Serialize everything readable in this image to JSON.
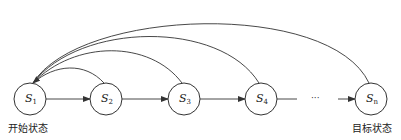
{
  "diagram": {
    "type": "state-transition",
    "nodes": [
      {
        "id": "s1",
        "label": "S",
        "sub": "1",
        "cx": 30,
        "cy": 99
      },
      {
        "id": "s2",
        "label": "S",
        "sub": "2",
        "cx": 106,
        "cy": 99
      },
      {
        "id": "s3",
        "label": "S",
        "sub": "3",
        "cx": 184,
        "cy": 99
      },
      {
        "id": "s4",
        "label": "S",
        "sub": "4",
        "cx": 261,
        "cy": 99
      },
      {
        "id": "sn",
        "label": "S",
        "sub": "n",
        "cx": 371,
        "cy": 99
      }
    ],
    "ellipsis": "···",
    "start_label": "开始状态",
    "goal_label": "目标状态",
    "forward_edges": [
      "s1→s2",
      "s2→s3",
      "s3→s4",
      "s4→…",
      "…→sn"
    ],
    "back_edges": [
      "s2→s1",
      "s3→s1",
      "s4→s1",
      "sn→s1"
    ],
    "stroke_color": "#333333"
  }
}
